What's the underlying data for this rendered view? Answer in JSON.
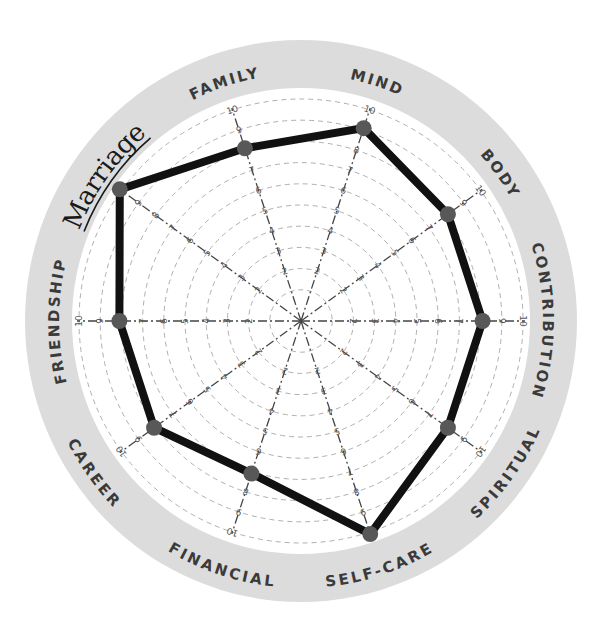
{
  "chart_data": {
    "type": "radar",
    "title": "",
    "scale": {
      "min": 0,
      "max": 10,
      "ticks": [
        1,
        2,
        3,
        4,
        5,
        6,
        7,
        8,
        9,
        10
      ]
    },
    "categories": [
      "Mind",
      "Body",
      "Contribution",
      "Spiritual",
      "Self-Care",
      "Financial",
      "Career",
      "Friendship",
      "Marriage",
      "Family"
    ],
    "labels_display": [
      "MIND",
      "BODY",
      "CONTRIBUTION",
      "SPIRITUAL",
      "SELF-CARE",
      "FINANCIAL",
      "CAREER",
      "FRIENDSHIP",
      "Marriage",
      "FAMILY"
    ],
    "angles_deg": [
      18,
      54,
      90,
      126,
      162,
      198,
      234,
      270,
      306,
      342
    ],
    "series": [
      {
        "name": "Scores",
        "values": [
          9,
          8,
          8,
          8,
          10,
          7,
          8,
          8,
          10,
          8
        ]
      }
    ],
    "annotations": [
      {
        "text": "Marriage",
        "style": "handwritten, underlined"
      }
    ],
    "grid": "dashed concentric circles, dashed spokes"
  },
  "colors": {
    "ring": "#d9d9d9",
    "line": "#111111",
    "dot": "#585858",
    "grid": "#9a9a9a",
    "label": "#3a3a3a"
  }
}
